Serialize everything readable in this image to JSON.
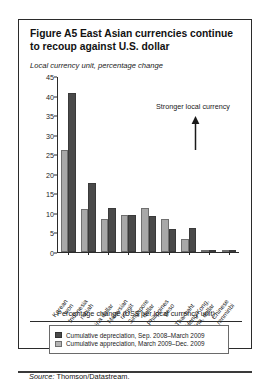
{
  "figure": {
    "title": "Figure A5  East Asian currencies continue to recoup against U.S. dollar",
    "subtitle": "Local currency unit, percentage change",
    "annotation": "Stronger local currency",
    "xaxis_title": "Percentage change (US$ per local currency unit)",
    "source_label": "Source:",
    "source_text": "Thomson/Datastream."
  },
  "legend": {
    "items": [
      {
        "label": "Cumulative depreciation, Sep. 2008–March 2009",
        "color": "#4a4a4a",
        "key": "depreciation"
      },
      {
        "label": "Cumulative appreciation, March 2009–Dec. 2009",
        "color": "#b4b4b4",
        "key": "appreciation"
      }
    ]
  },
  "chart_data": {
    "type": "bar",
    "title": "Figure A5  East Asian currencies continue to recoup against U.S. dollar",
    "xlabel": "Percentage change (US$ per local currency unit)",
    "ylabel": "Local currency unit, percentage change",
    "ylim": [
      0,
      45
    ],
    "yticks": [
      0,
      5,
      10,
      15,
      20,
      25,
      30,
      35,
      40,
      45
    ],
    "grid": false,
    "legend_position": "bottom",
    "categories": [
      "Korean won",
      "Indonesia rupiah",
      "China dollar",
      "Malaysian ringgit",
      "Singapore dollar",
      "Philippines peso",
      "Thai baht",
      "Hong Kong, China, dollar",
      "Chinese renminbi"
    ],
    "category_lines": [
      [
        "Korean",
        "won"
      ],
      [
        "Indonesia",
        "rupiah"
      ],
      [
        "China dollar"
      ],
      [
        "Malaysian",
        "ringgit"
      ],
      [
        "Singapore",
        "dollar"
      ],
      [
        "Philippines",
        "peso"
      ],
      [
        "Thai baht"
      ],
      [
        "Hong Kong,",
        "China, dollar"
      ],
      [
        "Chinese",
        "renminbi"
      ]
    ],
    "series": [
      {
        "name": "Cumulative appreciation, March 2009–Dec. 2009",
        "color": "#a8a8a8",
        "values": [
          26.2,
          11.0,
          8.5,
          9.5,
          11.3,
          8.5,
          3.2,
          0.2,
          0.1
        ]
      },
      {
        "name": "Cumulative depreciation, Sep. 2008–March 2009",
        "color": "#4a4a4a",
        "values": [
          40.8,
          17.7,
          11.3,
          9.5,
          9.3,
          5.8,
          6.2,
          0.6,
          0.2
        ]
      }
    ],
    "annotations": [
      {
        "text": "Stronger local currency",
        "arrow": "up"
      }
    ]
  }
}
